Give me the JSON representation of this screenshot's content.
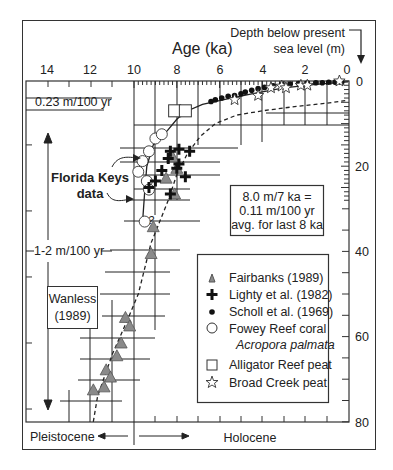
{
  "chart_data": {
    "type": "scatter",
    "title": "",
    "xlabel": "Age (ka)",
    "ylabel": "Depth below present sea level (m)",
    "xlim": [
      15,
      0
    ],
    "ylim": [
      0,
      80
    ],
    "x_reversed": true,
    "y_reversed": true,
    "x_ticks": [
      14,
      12,
      10,
      8,
      6,
      4,
      2,
      0
    ],
    "y_ticks": [
      0,
      20,
      40,
      60,
      80
    ],
    "grid": false,
    "legend_position": "lower right (inside)",
    "series": [
      {
        "name": "Fairbanks (1989)",
        "marker": "triangle",
        "color": "#8a8a8a",
        "points": [
          [
            8.0,
            20.5
          ],
          [
            8.1,
            26.5
          ],
          [
            9.1,
            34.2
          ],
          [
            9.2,
            40.5
          ],
          [
            10.4,
            55.5
          ],
          [
            10.2,
            57.5
          ],
          [
            10.6,
            61.5
          ],
          [
            10.8,
            64.5
          ],
          [
            11.3,
            67.8
          ],
          [
            11.1,
            69.5
          ],
          [
            11.9,
            72.5
          ],
          [
            11.4,
            71.8
          ],
          [
            8.5,
            22.8
          ],
          [
            8.2,
            17.8
          ]
        ]
      },
      {
        "name": "Lighty et al. (1982)",
        "marker": "plus",
        "color": "#111111",
        "points": [
          [
            8.3,
            16.5
          ],
          [
            7.9,
            16.0
          ],
          [
            7.4,
            16.5
          ],
          [
            8.4,
            18.2
          ],
          [
            7.9,
            19.5
          ],
          [
            8.7,
            21.0
          ],
          [
            7.6,
            22.5
          ],
          [
            9.0,
            23.5
          ],
          [
            9.3,
            25.0
          ],
          [
            8.3,
            26.5
          ],
          [
            8.0,
            20.5
          ]
        ]
      },
      {
        "name": "Scholl et al. (1969)",
        "marker": "dot",
        "color": "#111111",
        "points": [
          [
            6.4,
            4.8
          ],
          [
            6.2,
            4.4
          ],
          [
            5.9,
            4.0
          ],
          [
            5.6,
            3.6
          ],
          [
            5.3,
            3.4
          ],
          [
            5.0,
            3.0
          ],
          [
            4.8,
            2.6
          ],
          [
            4.5,
            2.2
          ],
          [
            4.2,
            1.8
          ],
          [
            3.9,
            1.5
          ],
          [
            3.5,
            1.1
          ],
          [
            3.1,
            0.8
          ],
          [
            2.7,
            0.7
          ],
          [
            2.3,
            0.6
          ],
          [
            1.9,
            0.5
          ],
          [
            1.5,
            0.4
          ],
          [
            1.2,
            0.4
          ],
          [
            0.9,
            0.3
          ],
          [
            0.6,
            0.3
          ],
          [
            0.3,
            0.2
          ]
        ]
      },
      {
        "name": "Fowey Reef coral Acropora palmata",
        "marker": "circle",
        "color": "#ffffff",
        "points": [
          [
            9.0,
            13.5
          ],
          [
            8.7,
            12.5
          ],
          [
            9.3,
            16.5
          ],
          [
            9.6,
            18.8
          ],
          [
            9.8,
            21.3
          ],
          [
            9.4,
            23.5
          ],
          [
            9.3,
            25.5
          ],
          [
            9.5,
            33.0
          ]
        ]
      },
      {
        "name": "Alligator Reef peat",
        "marker": "square",
        "color": "#ffffff",
        "points": [
          [
            8.1,
            7.0
          ],
          [
            7.6,
            7.0
          ]
        ]
      },
      {
        "name": "Broad Creek peat",
        "marker": "star",
        "color": "#ffffff",
        "points": [
          [
            5.3,
            4.4
          ],
          [
            4.2,
            3.4
          ],
          [
            3.6,
            1.6
          ],
          [
            3.1,
            1.2
          ],
          [
            2.9,
            1.6
          ],
          [
            2.2,
            1.0
          ],
          [
            1.9,
            1.0
          ],
          [
            0.4,
            0.0
          ]
        ]
      }
    ],
    "curves": [
      {
        "name": "solid fit",
        "style": "solid",
        "points": [
          [
            9.6,
            33
          ],
          [
            9.5,
            26
          ],
          [
            9.4,
            20
          ],
          [
            9.1,
            15
          ],
          [
            8.5,
            12
          ],
          [
            8.0,
            9
          ],
          [
            7.6,
            7.2
          ],
          [
            6.8,
            5.5
          ],
          [
            5.8,
            4.4
          ],
          [
            4.5,
            3.0
          ],
          [
            3.0,
            1.6
          ],
          [
            1.5,
            0.8
          ],
          [
            0,
            0.2
          ]
        ]
      },
      {
        "name": "dashed fit",
        "style": "dashed",
        "points": [
          [
            11.9,
            80
          ],
          [
            11.7,
            74
          ],
          [
            11.0,
            64
          ],
          [
            10.3,
            56
          ],
          [
            9.8,
            50
          ],
          [
            9.5,
            44
          ],
          [
            9.2,
            38
          ],
          [
            8.8,
            33
          ],
          [
            8.4,
            28
          ],
          [
            8.0,
            22
          ],
          [
            7.5,
            17
          ],
          [
            6.9,
            13
          ],
          [
            6.2,
            10
          ],
          [
            5.2,
            8
          ],
          [
            4.0,
            7
          ],
          [
            2.5,
            6
          ],
          [
            1.0,
            5.2
          ],
          [
            0,
            4.5
          ]
        ]
      }
    ],
    "annotations": [
      "0.23 m/100 yr",
      "1-2 m/100 yr",
      "Wanless (1989)",
      "Florida Keys data",
      "8.0 m/7 ka = 0.11 m/100 yr avg. for last 8 ka",
      "Pleistocene",
      "Holocene"
    ]
  },
  "labels": {
    "x_axis_title": "Age (ka)",
    "y_axis_title_line1": "Depth below present",
    "y_axis_title_line2": "sea level (m)",
    "rate_top": "0.23 m/100 yr",
    "rate_mid": "1-2 m/100 yr",
    "wanless_line1": "Wanless",
    "wanless_line2": "(1989)",
    "florida_line1": "Florida Keys",
    "florida_line2": "data",
    "avg_line1": "8.0 m/7 ka =",
    "avg_line2": "0.11 m/100 yr",
    "avg_line3": "avg. for last 8 ka",
    "pleistocene": "Pleistocene",
    "holocene": "Holocene"
  },
  "x_tick_labels": [
    "14",
    "12",
    "10",
    "8",
    "6",
    "4",
    "2",
    "0"
  ],
  "y_tick_labels": [
    "0",
    "20",
    "40",
    "60",
    "80"
  ],
  "legend": [
    {
      "label": "Fairbanks  (1989)",
      "marker": "triangle"
    },
    {
      "label": "Lighty et al. (1982)",
      "marker": "plus"
    },
    {
      "label": "Scholl et al. (1969)",
      "marker": "dot"
    },
    {
      "label": "Fowey Reef coral",
      "label2": "Acropora palmata",
      "marker": "circle"
    },
    {
      "label": "Alligator Reef peat",
      "marker": "square"
    },
    {
      "label": "Broad Creek peat",
      "marker": "star"
    }
  ]
}
